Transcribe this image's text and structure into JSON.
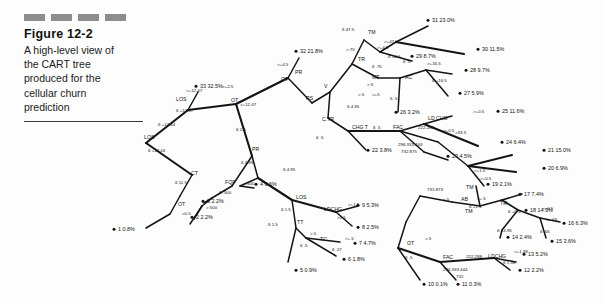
{
  "figure": {
    "dashes": 4,
    "label": "Figure 12-2",
    "description": "A high-level view of the CART tree produced for the cellular churn prediction",
    "desc_lines": [
      "A high-level view of",
      "the CART tree",
      "produced for the",
      "cellular churn",
      "prediction"
    ]
  },
  "colors": {
    "dash": "#8d8d8d",
    "ink": "#141414",
    "rule": "#3a3a3a",
    "page": "#fdfdfd"
  },
  "chart_data": {
    "type": "diagram",
    "subtype": "cart-decision-tree",
    "title": "A high-level view of the CART tree produced for the cellular churn prediction",
    "leaf_count": 33,
    "leaves": [
      {
        "id": 1,
        "label": "1 0.8%",
        "value": 0.8,
        "x": 118,
        "y": 231
      },
      {
        "id": 2,
        "label": "2 2.2%",
        "value": 2.2,
        "x": 196,
        "y": 219
      },
      {
        "id": 3,
        "label": "3 2.2%",
        "value": 2.2,
        "x": 207,
        "y": 203
      },
      {
        "id": 4,
        "label": "4 6.6%",
        "value": 6.6,
        "x": 260,
        "y": 186
      },
      {
        "id": 5,
        "label": "5 0.9%",
        "value": 0.9,
        "x": 300,
        "y": 272
      },
      {
        "id": 6,
        "label": "6 1.8%",
        "value": 1.8,
        "x": 348,
        "y": 261
      },
      {
        "id": 7,
        "label": "7 4.7%",
        "value": 4.7,
        "x": 359,
        "y": 245
      },
      {
        "id": 8,
        "label": "8 2.5%",
        "value": 2.5,
        "x": 362,
        "y": 229
      },
      {
        "id": 9,
        "label": "9 5.3%",
        "value": 5.3,
        "x": 362,
        "y": 207
      },
      {
        "id": 10,
        "label": "10 0.1%",
        "value": 0.1,
        "x": 428,
        "y": 286
      },
      {
        "id": 11,
        "label": "11 0.3%",
        "value": 0.3,
        "x": 462,
        "y": 286
      },
      {
        "id": 12,
        "label": "12 2.2%",
        "value": 2.2,
        "x": 524,
        "y": 272
      },
      {
        "id": 13,
        "label": "13 5.2%",
        "value": 5.2,
        "x": 528,
        "y": 256
      },
      {
        "id": 14,
        "label": "14 2.4%",
        "value": 2.4,
        "x": 512,
        "y": 239
      },
      {
        "id": 15,
        "label": "15 3.6%",
        "value": 3.6,
        "x": 556,
        "y": 243
      },
      {
        "id": 16,
        "label": "16 6.3%",
        "value": 6.3,
        "x": 568,
        "y": 225
      },
      {
        "id": 17,
        "label": "17 7.4%",
        "value": 7.4,
        "x": 524,
        "y": 196
      },
      {
        "id": 18,
        "label": "18 14.3%",
        "value": 14.3,
        "x": 530,
        "y": 212
      },
      {
        "id": 19,
        "label": "19 2.1%",
        "value": 2.1,
        "x": 492,
        "y": 186
      },
      {
        "id": 20,
        "label": "20 6.9%",
        "value": 6.9,
        "x": 548,
        "y": 170
      },
      {
        "id": 21,
        "label": "21 15.0%",
        "value": 15.0,
        "x": 548,
        "y": 152
      },
      {
        "id": 22,
        "label": "22 3.8%",
        "value": 3.8,
        "x": 372,
        "y": 152
      },
      {
        "id": 23,
        "label": "23 4.5%",
        "value": 4.5,
        "x": 452,
        "y": 158
      },
      {
        "id": 24,
        "label": "24 6.4%",
        "value": 6.4,
        "x": 506,
        "y": 144
      },
      {
        "id": 25,
        "label": "25 11.6%",
        "value": 11.6,
        "x": 502,
        "y": 113
      },
      {
        "id": 26,
        "label": "26 3.2%",
        "value": 3.2,
        "x": 400,
        "y": 114
      },
      {
        "id": 27,
        "label": "27 5.9%",
        "value": 5.9,
        "x": 464,
        "y": 95
      },
      {
        "id": 28,
        "label": "28 9.7%",
        "value": 9.7,
        "x": 470,
        "y": 72
      },
      {
        "id": 29,
        "label": "29 8.7%",
        "value": 8.7,
        "x": 416,
        "y": 58
      },
      {
        "id": 30,
        "label": "30 11.5%",
        "value": 11.5,
        "x": 482,
        "y": 51
      },
      {
        "id": 31,
        "label": "31 23.0%",
        "value": 23.0,
        "x": 432,
        "y": 22
      },
      {
        "id": 32,
        "label": "32 21.8%",
        "value": 21.8,
        "x": 300,
        "y": 53
      },
      {
        "id": 33,
        "label": "33 32.5%",
        "value": 32.5,
        "x": 200,
        "y": 88
      }
    ],
    "split_labels": [
      {
        "text": "LOS",
        "x": 144,
        "y": 139
      },
      {
        "text": "LOS",
        "x": 176,
        "y": 101
      },
      {
        "text": "OT",
        "x": 231,
        "y": 102
      },
      {
        "text": "OT",
        "x": 281,
        "y": 81
      },
      {
        "text": "CT",
        "x": 191,
        "y": 175
      },
      {
        "text": "OT",
        "x": 178,
        "y": 206
      },
      {
        "text": "FQF",
        "x": 225,
        "y": 184
      },
      {
        "text": "PR",
        "x": 295,
        "y": 74
      },
      {
        "text": "RS",
        "x": 306,
        "y": 100
      },
      {
        "text": "V",
        "x": 324,
        "y": 88
      },
      {
        "text": "PR",
        "x": 252,
        "y": 151
      },
      {
        "text": "C.TR",
        "x": 322,
        "y": 121
      },
      {
        "text": "CHG T",
        "x": 352,
        "y": 129
      },
      {
        "text": "FAC",
        "x": 393,
        "y": 129
      },
      {
        "text": "TR",
        "x": 358,
        "y": 61
      },
      {
        "text": "TM",
        "x": 368,
        "y": 34
      },
      {
        "text": "MT",
        "x": 372,
        "y": 79
      },
      {
        "text": "AC",
        "x": 405,
        "y": 79
      },
      {
        "text": "LD CHG",
        "x": 428,
        "y": 120
      },
      {
        "text": "LOS",
        "x": 296,
        "y": 199
      },
      {
        "text": "LDCHG",
        "x": 324,
        "y": 211
      },
      {
        "text": "TT",
        "x": 297,
        "y": 224
      },
      {
        "text": "TC",
        "x": 320,
        "y": 241
      },
      {
        "text": "AB",
        "x": 461,
        "y": 201
      },
      {
        "text": "TM",
        "x": 465,
        "y": 213
      },
      {
        "text": "TR",
        "x": 500,
        "y": 205
      },
      {
        "text": "TM",
        "x": 466,
        "y": 189
      },
      {
        "text": "OT",
        "x": 407,
        "y": 245
      },
      {
        "text": "FAC",
        "x": 443,
        "y": 259
      },
      {
        "text": "LDCHG",
        "x": 488,
        "y": 258
      }
    ],
    "branch_conditions": [
      {
        "text": "δ +12.47",
        "x": 176,
        "y": 112
      },
      {
        "text": ">+12.47",
        "x": 186,
        "y": 92
      },
      {
        "text": ">+12.47",
        "x": 240,
        "y": 106
      },
      {
        "text": "δ +12.44",
        "x": 158,
        "y": 126
      },
      {
        "text": "δ +12.44",
        "x": 148,
        "y": 152
      },
      {
        "text": ">+2.5",
        "x": 222,
        "y": 88
      },
      {
        "text": ">+4.5",
        "x": 277,
        "y": 66
      },
      {
        "text": "δ 2.5",
        "x": 236,
        "y": 131
      },
      {
        "text": "δ 4.95",
        "x": 241,
        "y": 164
      },
      {
        "text": ">.500",
        "x": 243,
        "y": 185
      },
      {
        "text": "δ .500",
        "x": 219,
        "y": 194
      },
      {
        "text": ">.500",
        "x": 206,
        "y": 209
      },
      {
        "text": ">0.5",
        "x": 182,
        "y": 215
      },
      {
        "text": "δ 11.5",
        "x": 175,
        "y": 184
      },
      {
        "text": "δ 4.95",
        "x": 283,
        "y": 171
      },
      {
        "text": "δ 4.35",
        "x": 347,
        "y": 108
      },
      {
        "text": "δ .5",
        "x": 316,
        "y": 139
      },
      {
        "text": ">.5",
        "x": 367,
        "y": 86
      },
      {
        "text": "δ 47.5",
        "x": 342,
        "y": 31
      },
      {
        "text": ">+47.5",
        "x": 384,
        "y": 43
      },
      {
        "text": ">+4.5",
        "x": 377,
        "y": 49
      },
      {
        "text": "δ +4.5",
        "x": 388,
        "y": 58
      },
      {
        "text": ">.75",
        "x": 346,
        "y": 51
      },
      {
        "text": "δ .75",
        "x": 372,
        "y": 68
      },
      {
        "text": ">+16.5",
        "x": 427,
        "y": 65
      },
      {
        "text": "δ +16.5",
        "x": 432,
        "y": 82
      },
      {
        "text": "δ .5",
        "x": 403,
        "y": 63
      },
      {
        "text": ">.5",
        "x": 358,
        "y": 96
      },
      {
        "text": "δ .5",
        "x": 390,
        "y": 100
      },
      {
        "text": "222.288",
        "x": 418,
        "y": 129
      },
      {
        "text": "δ .5",
        "x": 373,
        "y": 129
      },
      {
        "text": "296.333.444",
        "x": 398,
        "y": 146
      },
      {
        "text": "732.875",
        "x": 401,
        "y": 153
      },
      {
        "text": ">+0.5",
        "x": 443,
        "y": 132
      },
      {
        "text": ">+0.5",
        "x": 473,
        "y": 113
      },
      {
        "text": ">+1.5",
        "x": 474,
        "y": 172
      },
      {
        "text": ">+0.5",
        "x": 480,
        "y": 180
      },
      {
        "text": "731.873",
        "x": 427,
        "y": 191
      },
      {
        "text": "δ 1.5",
        "x": 281,
        "y": 211
      },
      {
        "text": ">+1.5",
        "x": 348,
        "y": 206
      },
      {
        "text": ">1.5",
        "x": 337,
        "y": 219
      },
      {
        "text": "δ 1.5",
        "x": 268,
        "y": 226
      },
      {
        "text": ">.5",
        "x": 310,
        "y": 235
      },
      {
        "text": ">+.5",
        "x": 345,
        "y": 240
      },
      {
        "text": "δ .5",
        "x": 300,
        "y": 247
      },
      {
        "text": "δ .27",
        "x": 332,
        "y": 251
      },
      {
        "text": ">.5",
        "x": 443,
        "y": 201
      },
      {
        "text": ">+.5",
        "x": 477,
        "y": 200
      },
      {
        "text": "δ +1.5",
        "x": 469,
        "y": 208
      },
      {
        "text": "δ +0.5",
        "x": 508,
        "y": 213
      },
      {
        "text": "δ +4.95",
        "x": 497,
        "y": 232
      },
      {
        "text": ">+0.5",
        "x": 542,
        "y": 210
      },
      {
        "text": ">+.65",
        "x": 546,
        "y": 221
      },
      {
        "text": "δ .65",
        "x": 540,
        "y": 233
      },
      {
        "text": ">.5",
        "x": 425,
        "y": 240
      },
      {
        "text": "δ .5",
        "x": 405,
        "y": 259
      },
      {
        "text": "222.288",
        "x": 466,
        "y": 258
      },
      {
        "text": "296.333.444",
        "x": 443,
        "y": 271
      },
      {
        "text": "732",
        "x": 456,
        "y": 278
      },
      {
        "text": "δ 1.38",
        "x": 503,
        "y": 264
      },
      {
        "text": ">+1.38",
        "x": 514,
        "y": 253
      },
      {
        "text": ">33.5",
        "x": 455,
        "y": 134
      },
      {
        "text": ">+5",
        "x": 372,
        "y": 96
      }
    ],
    "edges": [
      [
        146,
        143,
        188,
        110
      ],
      [
        146,
        143,
        192,
        175
      ],
      [
        188,
        110,
        198,
        92
      ],
      [
        188,
        110,
        236,
        104
      ],
      [
        236,
        104,
        288,
        78
      ],
      [
        236,
        104,
        252,
        156
      ],
      [
        288,
        78,
        299,
        58
      ],
      [
        288,
        78,
        312,
        103
      ],
      [
        312,
        103,
        330,
        92
      ],
      [
        330,
        92,
        352,
        64
      ],
      [
        330,
        92,
        328,
        118
      ],
      [
        352,
        64,
        364,
        40
      ],
      [
        352,
        64,
        378,
        78
      ],
      [
        364,
        40,
        380,
        52
      ],
      [
        380,
        52,
        396,
        42
      ],
      [
        396,
        42,
        428,
        26
      ],
      [
        396,
        42,
        464,
        54
      ],
      [
        380,
        52,
        408,
        60
      ],
      [
        378,
        78,
        400,
        78
      ],
      [
        400,
        78,
        426,
        70
      ],
      [
        426,
        70,
        452,
        74
      ],
      [
        426,
        70,
        448,
        96
      ],
      [
        400,
        78,
        398,
        112
      ],
      [
        328,
        118,
        348,
        131
      ],
      [
        348,
        131,
        366,
        150
      ],
      [
        348,
        131,
        400,
        131
      ],
      [
        400,
        131,
        424,
        124
      ],
      [
        424,
        124,
        452,
        116
      ],
      [
        424,
        124,
        478,
        146
      ],
      [
        400,
        131,
        424,
        152
      ],
      [
        424,
        152,
        448,
        160
      ],
      [
        400,
        131,
        438,
        142
      ],
      [
        438,
        142,
        468,
        166
      ],
      [
        468,
        166,
        512,
        155
      ],
      [
        468,
        166,
        516,
        172
      ],
      [
        468,
        166,
        484,
        186
      ],
      [
        252,
        156,
        258,
        178
      ],
      [
        252,
        156,
        232,
        186
      ],
      [
        258,
        178,
        292,
        200
      ],
      [
        258,
        178,
        240,
        186
      ],
      [
        240,
        186,
        254,
        188
      ],
      [
        232,
        186,
        212,
        198
      ],
      [
        212,
        198,
        202,
        206
      ],
      [
        202,
        206,
        190,
        224
      ],
      [
        202,
        206,
        194,
        219
      ],
      [
        212,
        198,
        204,
        203
      ],
      [
        192,
        175,
        180,
        196
      ],
      [
        180,
        196,
        170,
        214
      ],
      [
        170,
        214,
        146,
        228
      ],
      [
        292,
        200,
        296,
        228
      ],
      [
        292,
        200,
        336,
        212
      ],
      [
        336,
        212,
        358,
        206
      ],
      [
        336,
        212,
        352,
        226
      ],
      [
        296,
        228,
        306,
        238
      ],
      [
        296,
        228,
        288,
        262
      ],
      [
        306,
        238,
        340,
        242
      ],
      [
        306,
        238,
        336,
        256
      ],
      [
        420,
        196,
        452,
        202
      ],
      [
        452,
        202,
        480,
        206
      ],
      [
        480,
        206,
        502,
        200
      ],
      [
        502,
        200,
        522,
        194
      ],
      [
        502,
        200,
        518,
        210
      ],
      [
        518,
        210,
        540,
        218
      ],
      [
        540,
        218,
        560,
        222
      ],
      [
        540,
        218,
        546,
        238
      ],
      [
        518,
        210,
        502,
        230
      ],
      [
        502,
        230,
        500,
        238
      ],
      [
        480,
        206,
        476,
        186
      ],
      [
        420,
        196,
        406,
        222
      ],
      [
        406,
        222,
        398,
        248
      ],
      [
        398,
        248,
        420,
        280
      ],
      [
        398,
        248,
        440,
        262
      ],
      [
        440,
        262,
        456,
        280
      ],
      [
        440,
        262,
        494,
        258
      ],
      [
        494,
        258,
        516,
        262
      ],
      [
        494,
        258,
        510,
        270
      ],
      [
        408,
        60,
        412,
        61
      ]
    ]
  }
}
